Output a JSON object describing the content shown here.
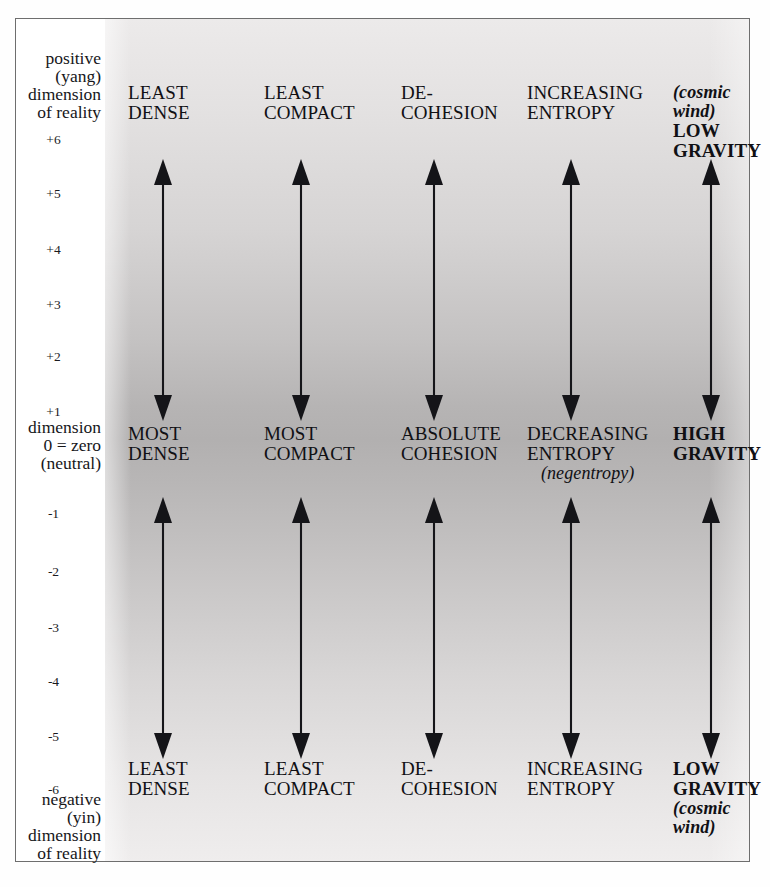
{
  "diagram": {
    "axis": {
      "top_block": {
        "line1": "positive",
        "line2": "(yang)",
        "line3": "dimension",
        "line4": "of reality"
      },
      "zero_block": {
        "line1": "dimension",
        "line2": "0 = zero",
        "line3": "(neutral)"
      },
      "bottom_block": {
        "line1": "negative",
        "line2": "(yin)",
        "line3": "dimension",
        "line4": "of reality"
      },
      "ticks": [
        {
          "label": "+6",
          "y": 113
        },
        {
          "label": "+5",
          "y": 167
        },
        {
          "label": "+4",
          "y": 223
        },
        {
          "label": "+3",
          "y": 278
        },
        {
          "label": "+2",
          "y": 330
        },
        {
          "label": "+1",
          "y": 385
        },
        {
          "label": "-1",
          "y": 487
        },
        {
          "label": "-2",
          "y": 545
        },
        {
          "label": "-3",
          "y": 601
        },
        {
          "label": "-4",
          "y": 655
        },
        {
          "label": "-5",
          "y": 710
        },
        {
          "label": "-6",
          "y": 763
        }
      ]
    },
    "columns": [
      {
        "name": "density",
        "arrow_x": 147,
        "label_x": 112,
        "top": {
          "lines": [
            "LEAST",
            "DENSE"
          ],
          "bold": false,
          "note": null,
          "note_style": null,
          "note_position": null
        },
        "middle": {
          "lines": [
            "MOST",
            "DENSE"
          ],
          "bold": false,
          "note": null,
          "note_style": null,
          "note_position": null
        },
        "bottom": {
          "lines": [
            "LEAST",
            "DENSE"
          ],
          "bold": false,
          "note": null,
          "note_style": null,
          "note_position": null
        }
      },
      {
        "name": "compactness",
        "arrow_x": 285,
        "label_x": 248,
        "top": {
          "lines": [
            "LEAST",
            "COMPACT"
          ],
          "bold": false,
          "note": null,
          "note_style": null,
          "note_position": null
        },
        "middle": {
          "lines": [
            "MOST",
            "COMPACT"
          ],
          "bold": false,
          "note": null,
          "note_style": null,
          "note_position": null
        },
        "bottom": {
          "lines": [
            "LEAST",
            "COMPACT"
          ],
          "bold": false,
          "note": null,
          "note_style": null,
          "note_position": null
        }
      },
      {
        "name": "cohesion",
        "arrow_x": 418,
        "label_x": 385,
        "top": {
          "lines": [
            "DE-",
            "COHESION"
          ],
          "bold": false,
          "note": null,
          "note_style": null,
          "note_position": null
        },
        "middle": {
          "lines": [
            "ABSOLUTE",
            "COHESION"
          ],
          "bold": false,
          "note": null,
          "note_style": null,
          "note_position": null
        },
        "bottom": {
          "lines": [
            "DE-",
            "COHESION"
          ],
          "bold": false,
          "note": null,
          "note_style": null,
          "note_position": null
        }
      },
      {
        "name": "entropy",
        "arrow_x": 555,
        "label_x": 511,
        "top": {
          "lines": [
            "INCREASING",
            "ENTROPY"
          ],
          "bold": false,
          "note": null,
          "note_style": null,
          "note_position": null
        },
        "middle": {
          "lines": [
            "DECREASING",
            "ENTROPY"
          ],
          "bold": false,
          "note": "(negentropy)",
          "note_style": "italic",
          "note_position": "below"
        },
        "bottom": {
          "lines": [
            "INCREASING",
            "ENTROPY"
          ],
          "bold": false,
          "note": null,
          "note_style": null,
          "note_position": null
        }
      },
      {
        "name": "gravity",
        "arrow_x": 695,
        "label_x": 657,
        "top": {
          "lines": [
            "LOW",
            "GRAVITY"
          ],
          "bold": true,
          "note": "(cosmic wind)",
          "note_style": "bold-italic",
          "note_position": "above"
        },
        "middle": {
          "lines": [
            "HIGH",
            "GRAVITY"
          ],
          "bold": true,
          "note": null,
          "note_style": null,
          "note_position": null
        },
        "bottom": {
          "lines": [
            "LOW",
            "GRAVITY"
          ],
          "bold": true,
          "note": "(cosmic wind)",
          "note_style": "bold-italic",
          "note_position": "below"
        }
      }
    ],
    "arrows": [
      {
        "name": "upper-arrow",
        "top": 140,
        "bottom": 402
      },
      {
        "name": "lower-arrow",
        "top": 478,
        "bottom": 740
      }
    ],
    "colors": {
      "border": "#6e6e6e",
      "ink": "#101014",
      "field_light": "#eceaea",
      "field_dark": "#b2b0b0",
      "page": "#ffffff"
    }
  }
}
